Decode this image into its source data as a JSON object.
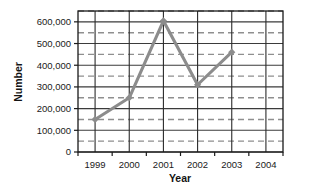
{
  "chart_data": {
    "type": "line",
    "title": "",
    "xlabel": "Year",
    "ylabel": "Number",
    "x": [
      "1999",
      "2000",
      "2001",
      "2002",
      "2003",
      "2004"
    ],
    "categories": [
      "1999",
      "2000",
      "2001",
      "2002",
      "2003",
      "2004"
    ],
    "values": [
      150000,
      250000,
      605000,
      310000,
      460000,
      null
    ],
    "series": [
      {
        "name": "Number",
        "values": [
          150000,
          250000,
          605000,
          310000,
          460000,
          null
        ]
      }
    ],
    "xlim": [
      1998.5,
      2004.5
    ],
    "ylim": [
      0,
      650000
    ],
    "ytick_values": [
      0,
      100000,
      200000,
      300000,
      400000,
      500000,
      600000
    ],
    "ytick_labels": [
      "0",
      "100,000",
      "200,000",
      "300,000",
      "400,000",
      "500,000",
      "600,000"
    ],
    "yminor_values": [
      50000,
      150000,
      250000,
      350000,
      450000,
      550000,
      650000
    ],
    "xtick_labels": [
      "1999",
      "2000",
      "2001",
      "2002",
      "2003",
      "2004"
    ],
    "grid": {
      "major_horizontal": true,
      "minor_horizontal_dashed": true,
      "vertical": true
    },
    "legend": {
      "visible": false,
      "position": "none"
    },
    "marker": "diamond",
    "colors": {
      "line": "#8c8c8c",
      "marker": "#8c8c8c",
      "major_gridline": "#3b3b3b",
      "minor_gridline": "#8f8f8f",
      "vertical_gridline": "#2b2b2b",
      "axis": "#1a1a1a",
      "text": "#141414",
      "background": "#ffffff"
    }
  }
}
